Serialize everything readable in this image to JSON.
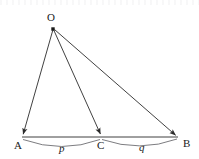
{
  "figure": {
    "type": "geometry-diagram",
    "background_color": "#ffffff",
    "line_color": "#2b2b2b",
    "arc_color": "#55555a",
    "label_color": "#1a1a1a",
    "vertices": [
      {
        "id": "O",
        "label": "O",
        "x": 53,
        "y": 29,
        "label_x": 47,
        "label_y": 12,
        "marker": "filled-square"
      },
      {
        "id": "A",
        "label": "A",
        "x": 22,
        "y": 137,
        "label_x": 14,
        "label_y": 140,
        "marker": "arrowhead"
      },
      {
        "id": "C",
        "label": "C",
        "x": 101,
        "y": 137,
        "label_x": 97,
        "label_y": 140,
        "marker": "arrowhead"
      },
      {
        "id": "B",
        "label": "B",
        "x": 178,
        "y": 137,
        "label_x": 183,
        "label_y": 138,
        "marker": "arrowhead"
      }
    ],
    "rays": [
      {
        "from": "O",
        "to": "A",
        "arrow_at": "A"
      },
      {
        "from": "O",
        "to": "C",
        "arrow_at": "C"
      },
      {
        "from": "O",
        "to": "B",
        "arrow_at": "B"
      }
    ],
    "base_line": {
      "from": "A",
      "to": "B"
    },
    "arcs": [
      {
        "id": "arc-p",
        "from": "A",
        "to": "C",
        "label": "p",
        "label_x": 59,
        "label_y": 143,
        "sag": 9
      },
      {
        "id": "arc-q",
        "from": "C",
        "to": "B",
        "label": "q",
        "label_x": 139,
        "label_y": 142,
        "sag": 9
      }
    ]
  }
}
